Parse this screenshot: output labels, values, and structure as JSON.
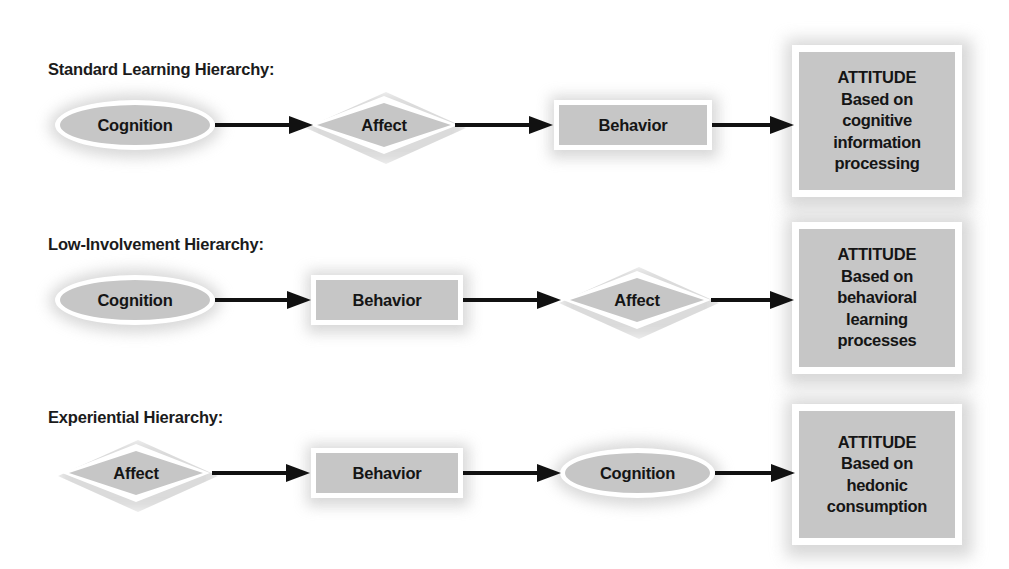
{
  "figure": {
    "background_color": "#ffffff",
    "shape_fill_color": "#c6c6c6",
    "shape_border_color": "#ffffff",
    "arrow_color": "#111111",
    "text_color": "#151515"
  },
  "rows": [
    {
      "label": "Standard Learning Hierarchy:",
      "nodes": [
        {
          "text": "Cognition",
          "shape": "ellipse"
        },
        {
          "text": "Affect",
          "shape": "diamond"
        },
        {
          "text": "Behavior",
          "shape": "rectangle"
        }
      ],
      "attitude": {
        "heading": "ATTITUDE",
        "lines": [
          "Based on",
          "cognitive",
          "information",
          "processing"
        ]
      }
    },
    {
      "label": "Low-Involvement Hierarchy:",
      "nodes": [
        {
          "text": "Cognition",
          "shape": "ellipse"
        },
        {
          "text": "Behavior",
          "shape": "rectangle"
        },
        {
          "text": "Affect",
          "shape": "diamond"
        }
      ],
      "attitude": {
        "heading": "ATTITUDE",
        "lines": [
          "Based on",
          "behavioral",
          "learning",
          "processes"
        ]
      }
    },
    {
      "label": "Experiential Hierarchy:",
      "nodes": [
        {
          "text": "Affect",
          "shape": "diamond"
        },
        {
          "text": "Behavior",
          "shape": "rectangle"
        },
        {
          "text": "Cognition",
          "shape": "ellipse"
        }
      ],
      "attitude": {
        "heading": "ATTITUDE",
        "lines": [
          "Based on",
          "hedonic",
          "consumption"
        ]
      }
    }
  ]
}
